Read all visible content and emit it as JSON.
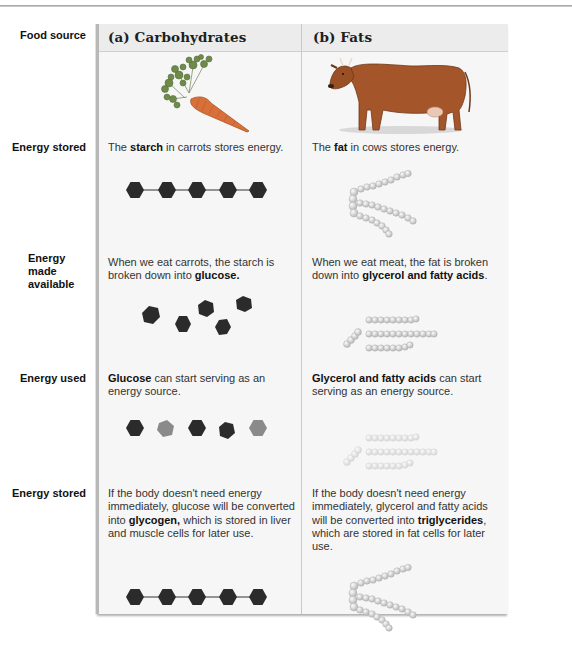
{
  "columns": [
    {
      "label": "(a)  Carbohydrates",
      "food_image": "carrot-illustration"
    },
    {
      "label": "(b)  Fats",
      "food_image": "cow-illustration"
    }
  ],
  "rows": [
    {
      "label": "Food source"
    },
    {
      "label": "Energy stored"
    },
    {
      "label_line1": "Energy made",
      "label_line2": "available"
    },
    {
      "label": "Energy used"
    },
    {
      "label": "Energy stored"
    }
  ],
  "carbohydrates": {
    "energy_stored": {
      "pre": "The ",
      "bold": "starch",
      "post": " in carrots stores energy.",
      "figure": "chain of 5 dark hexagons (starch)"
    },
    "energy_made_available": {
      "pre": "When we eat carrots, the starch is broken down into ",
      "bold": "glucose.",
      "post": "",
      "figure": "5 separate dark hexagons (glucose)"
    },
    "energy_used": {
      "pre": "",
      "bold": "Glucose",
      "post": " can start serving as an energy source.",
      "figure": "5 hexagons, alternating dark and gray"
    },
    "energy_stored_again": {
      "pre": "If the body doesn't need energy immediately, glucose will be converted into ",
      "bold": "glycogen,",
      "post": " which is stored in liver and muscle cells for later use.",
      "figure": "chain of 5 dark hexagons (glycogen)"
    }
  },
  "fats": {
    "energy_stored": {
      "pre": "The ",
      "bold": "fat",
      "post": " in cows stores energy.",
      "figure": "triglyceride: glycerol backbone with 3 fatty acid chains"
    },
    "energy_made_available": {
      "pre": "When we eat meat, the fat is broken down into ",
      "bold": "glycerol and fatty acids",
      "post": ".",
      "figure": "separate glycerol and 3 fatty acid chains"
    },
    "energy_used": {
      "pre": "",
      "bold": "Glycerol and fatty acids",
      "post": " can start serving as an energy source.",
      "figure": "faded glycerol and fatty acid chains"
    },
    "energy_stored_again": {
      "pre": "If the body doesn't need energy immediately, glycerol and fatty acids will be converted into ",
      "bold": "triglycerides",
      "post": ", which are stored in fat cells for later use.",
      "figure": "triglyceride: glycerol backbone with 3 fatty acid chains"
    }
  },
  "colors": {
    "hexagon_dark": "#2b2b2b",
    "hexagon_gray": "#8a8a8a",
    "bead": "#d4d4d4",
    "card_bg": "#f6f6f6",
    "header_bg": "#ececec"
  }
}
